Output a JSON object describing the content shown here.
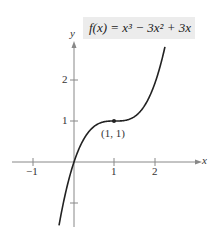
{
  "chart_data": {
    "type": "line",
    "title": "",
    "equation_label": "f(x) = x³ − 3x² + 3x",
    "xlabel": "x",
    "ylabel": "y",
    "xlim": [
      -1.8,
      2.4
    ],
    "ylim": [
      -1.5,
      2.6
    ],
    "x_ticks": [
      -1,
      1,
      2
    ],
    "x_tick_labels": [
      "−1",
      "1",
      "2"
    ],
    "y_ticks": [
      -1,
      1,
      2
    ],
    "y_tick_labels": [
      "",
      "1",
      "2"
    ],
    "grid": false,
    "series": [
      {
        "name": "f(x) = x³ − 3x² + 3x",
        "x": [
          -0.4,
          -0.2,
          0,
          0.2,
          0.4,
          0.6,
          0.8,
          1.0,
          1.2,
          1.4,
          1.6,
          1.8,
          2.0,
          2.2
        ],
        "y": [
          -1.744,
          -0.728,
          0,
          0.488,
          0.784,
          0.936,
          0.992,
          1.0,
          1.008,
          1.064,
          1.216,
          1.512,
          2.0,
          2.728
        ]
      }
    ],
    "annotations": [
      {
        "text": "(1, 1)",
        "x": 1,
        "y": 1,
        "marker": "point"
      }
    ]
  },
  "labels": {
    "x_axis": "x",
    "y_axis": "y",
    "point": "(1, 1)",
    "tick_neg1": "−1",
    "tick_x1": "1",
    "tick_x2": "2",
    "tick_y1": "1",
    "tick_y2": "2",
    "equation": "f(x) = x³ − 3x² + 3x"
  }
}
